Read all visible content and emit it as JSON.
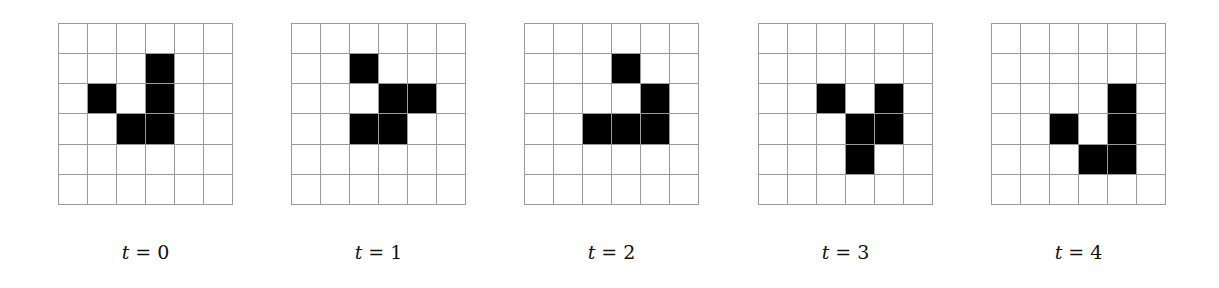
{
  "figure": {
    "grid_size": 6,
    "panels": [
      {
        "label_var": "t",
        "label_eq": " = ",
        "label_val": "0",
        "left": 58,
        "alive": [
          [
            1,
            3
          ],
          [
            2,
            1
          ],
          [
            2,
            3
          ],
          [
            3,
            2
          ],
          [
            3,
            3
          ]
        ]
      },
      {
        "label_var": "t",
        "label_eq": " = ",
        "label_val": "1",
        "left": 291,
        "alive": [
          [
            1,
            2
          ],
          [
            2,
            3
          ],
          [
            2,
            4
          ],
          [
            3,
            2
          ],
          [
            3,
            3
          ]
        ]
      },
      {
        "label_var": "t",
        "label_eq": " = ",
        "label_val": "2",
        "left": 524,
        "alive": [
          [
            1,
            3
          ],
          [
            2,
            4
          ],
          [
            3,
            2
          ],
          [
            3,
            3
          ],
          [
            3,
            4
          ]
        ]
      },
      {
        "label_var": "t",
        "label_eq": " = ",
        "label_val": "3",
        "left": 758,
        "alive": [
          [
            2,
            2
          ],
          [
            2,
            4
          ],
          [
            3,
            3
          ],
          [
            3,
            4
          ],
          [
            4,
            3
          ]
        ]
      },
      {
        "label_var": "t",
        "label_eq": " = ",
        "label_val": "4",
        "left": 991,
        "alive": [
          [
            2,
            4
          ],
          [
            3,
            2
          ],
          [
            3,
            4
          ],
          [
            4,
            3
          ],
          [
            4,
            4
          ]
        ]
      }
    ],
    "colors": {
      "alive": "#000000",
      "dead": "#ffffff",
      "gridline": "#9a9a9a"
    }
  }
}
